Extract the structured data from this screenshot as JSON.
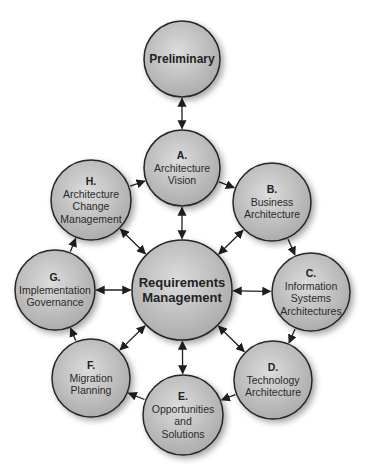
{
  "diagram": {
    "colors": {
      "fill_center": "#dcdcdc",
      "fill_edge": "#a9a9a9",
      "stroke": "#262626",
      "arrow": "#1e1e1e",
      "background": "#ffffff"
    },
    "nodes": [
      {
        "id": "preliminary",
        "letter": "",
        "lines": [
          "Preliminary"
        ],
        "cx": 182,
        "cy": 59,
        "r": 38,
        "style": "prelim"
      },
      {
        "id": "a",
        "letter": "A.",
        "lines": [
          "Architecture",
          "Vision"
        ],
        "cx": 182,
        "cy": 168,
        "r": 38
      },
      {
        "id": "b",
        "letter": "B.",
        "lines": [
          "Business",
          "Architecture"
        ],
        "cx": 272,
        "cy": 202,
        "r": 39
      },
      {
        "id": "c",
        "letter": "C.",
        "lines": [
          "Information",
          "Systems",
          "Architectures"
        ],
        "cx": 311,
        "cy": 292,
        "r": 39
      },
      {
        "id": "d",
        "letter": "D.",
        "lines": [
          "Technology",
          "Architecture"
        ],
        "cx": 273,
        "cy": 380,
        "r": 39
      },
      {
        "id": "e",
        "letter": "E.",
        "lines": [
          "Opportunities",
          "and",
          "Solutions"
        ],
        "cx": 183,
        "cy": 415,
        "r": 40
      },
      {
        "id": "f",
        "letter": "F.",
        "lines": [
          "Migration",
          "Planning"
        ],
        "cx": 91,
        "cy": 378,
        "r": 39
      },
      {
        "id": "g",
        "letter": "G.",
        "lines": [
          "Implementation",
          "Governance"
        ],
        "cx": 55,
        "cy": 290,
        "r": 40
      },
      {
        "id": "h",
        "letter": "H.",
        "lines": [
          "Architecture",
          "Change",
          "Management"
        ],
        "cx": 91,
        "cy": 200,
        "r": 40
      },
      {
        "id": "rm",
        "letter": "",
        "lines": [
          "Requirements",
          "Management"
        ],
        "cx": 182,
        "cy": 290,
        "r": 50,
        "style": "big"
      }
    ],
    "edges": [
      {
        "from": "preliminary",
        "to": "a",
        "type": "double"
      },
      {
        "from": "a",
        "to": "b",
        "type": "single"
      },
      {
        "from": "b",
        "to": "c",
        "type": "single"
      },
      {
        "from": "c",
        "to": "d",
        "type": "single"
      },
      {
        "from": "d",
        "to": "e",
        "type": "single"
      },
      {
        "from": "e",
        "to": "f",
        "type": "single"
      },
      {
        "from": "f",
        "to": "g",
        "type": "single"
      },
      {
        "from": "g",
        "to": "h",
        "type": "single"
      },
      {
        "from": "h",
        "to": "a",
        "type": "single"
      },
      {
        "from": "rm",
        "to": "a",
        "type": "double"
      },
      {
        "from": "rm",
        "to": "b",
        "type": "double"
      },
      {
        "from": "rm",
        "to": "c",
        "type": "double"
      },
      {
        "from": "rm",
        "to": "d",
        "type": "double"
      },
      {
        "from": "rm",
        "to": "e",
        "type": "double"
      },
      {
        "from": "rm",
        "to": "f",
        "type": "double"
      },
      {
        "from": "rm",
        "to": "g",
        "type": "double"
      },
      {
        "from": "rm",
        "to": "h",
        "type": "double"
      }
    ]
  }
}
